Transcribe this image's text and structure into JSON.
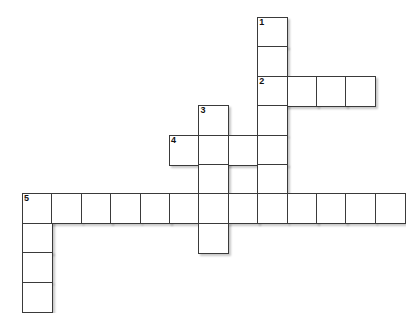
{
  "puzzle": {
    "title": "Crossword Grid",
    "cell_size": 29.4,
    "origin": {
      "x": 22,
      "y": 17
    },
    "grid_cols": 13,
    "grid_rows": 10,
    "colors": {
      "background": "#ffffff",
      "cell_fill": "#ffffff",
      "cell_border": "#3a3a3a",
      "number_text": "#111111",
      "shadow": "rgba(0,0,0,0.22)"
    },
    "entries": [
      {
        "number": "1",
        "direction": "down",
        "row": 0,
        "col": 8,
        "length": 7
      },
      {
        "number": "2",
        "direction": "across",
        "row": 2,
        "col": 8,
        "length": 4
      },
      {
        "number": "3",
        "direction": "down",
        "row": 3,
        "col": 6,
        "length": 5
      },
      {
        "number": "4",
        "direction": "across",
        "row": 4,
        "col": 5,
        "length": 4
      },
      {
        "number": "5",
        "direction": "across",
        "row": 6,
        "col": 0,
        "length": 13
      },
      {
        "number": "5",
        "direction": "down",
        "row": 6,
        "col": 0,
        "length": 4
      }
    ],
    "cells": [
      {
        "row": 0,
        "col": 8,
        "number": "1",
        "letter": ""
      },
      {
        "row": 1,
        "col": 8,
        "number": "",
        "letter": ""
      },
      {
        "row": 2,
        "col": 8,
        "number": "2",
        "letter": ""
      },
      {
        "row": 2,
        "col": 9,
        "number": "",
        "letter": ""
      },
      {
        "row": 2,
        "col": 10,
        "number": "",
        "letter": ""
      },
      {
        "row": 2,
        "col": 11,
        "number": "",
        "letter": ""
      },
      {
        "row": 3,
        "col": 8,
        "number": "",
        "letter": ""
      },
      {
        "row": 3,
        "col": 6,
        "number": "3",
        "letter": ""
      },
      {
        "row": 4,
        "col": 5,
        "number": "4",
        "letter": ""
      },
      {
        "row": 4,
        "col": 6,
        "number": "",
        "letter": ""
      },
      {
        "row": 4,
        "col": 7,
        "number": "",
        "letter": ""
      },
      {
        "row": 4,
        "col": 8,
        "number": "",
        "letter": ""
      },
      {
        "row": 5,
        "col": 6,
        "number": "",
        "letter": ""
      },
      {
        "row": 5,
        "col": 8,
        "number": "",
        "letter": ""
      },
      {
        "row": 6,
        "col": 0,
        "number": "5",
        "letter": ""
      },
      {
        "row": 6,
        "col": 1,
        "number": "",
        "letter": ""
      },
      {
        "row": 6,
        "col": 2,
        "number": "",
        "letter": ""
      },
      {
        "row": 6,
        "col": 3,
        "number": "",
        "letter": ""
      },
      {
        "row": 6,
        "col": 4,
        "number": "",
        "letter": ""
      },
      {
        "row": 6,
        "col": 5,
        "number": "",
        "letter": ""
      },
      {
        "row": 6,
        "col": 6,
        "number": "",
        "letter": ""
      },
      {
        "row": 6,
        "col": 7,
        "number": "",
        "letter": ""
      },
      {
        "row": 6,
        "col": 8,
        "number": "",
        "letter": ""
      },
      {
        "row": 6,
        "col": 9,
        "number": "",
        "letter": ""
      },
      {
        "row": 6,
        "col": 10,
        "number": "",
        "letter": ""
      },
      {
        "row": 6,
        "col": 11,
        "number": "",
        "letter": ""
      },
      {
        "row": 6,
        "col": 12,
        "number": "",
        "letter": ""
      },
      {
        "row": 7,
        "col": 0,
        "number": "",
        "letter": ""
      },
      {
        "row": 7,
        "col": 6,
        "number": "",
        "letter": ""
      },
      {
        "row": 8,
        "col": 0,
        "number": "",
        "letter": ""
      },
      {
        "row": 9,
        "col": 0,
        "number": "",
        "letter": ""
      }
    ]
  }
}
